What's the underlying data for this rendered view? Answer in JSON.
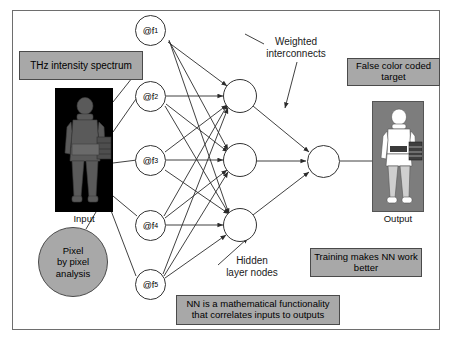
{
  "diagram": {
    "title_labels": {
      "weighted_interconnects": "Weighted\ninterconnects",
      "hidden_layer_nodes": "Hidden\nlayer nodes",
      "input_caption": "Input",
      "output_caption": "Output"
    },
    "callout_boxes": [
      {
        "id": "thz-spectrum",
        "text": "THz intensity spectrum"
      },
      {
        "id": "false-color",
        "text": "False color coded\ntarget"
      },
      {
        "id": "training",
        "text": "Training makes NN work\nbetter"
      },
      {
        "id": "nn-definition",
        "text": "NN is a mathematical functionality\nthat correlates inputs to outputs"
      }
    ],
    "pixel_circle": {
      "text": "Pixel\nby pixel\nanalysis"
    },
    "input_nodes": [
      {
        "label": "@f",
        "sub": "1"
      },
      {
        "label": "@f",
        "sub": "2"
      },
      {
        "label": "@f",
        "sub": "3"
      },
      {
        "label": "@f",
        "sub": "4"
      },
      {
        "label": "@f",
        "sub": "5"
      }
    ],
    "hidden_nodes": [
      {
        "label": ""
      },
      {
        "label": ""
      },
      {
        "label": ""
      }
    ],
    "output_nodes": [
      {
        "label": ""
      }
    ],
    "colors": {
      "callout_fill": "#a8a8a8",
      "callout_border": "#4a4a4a",
      "frame_border": "#6e6e6e",
      "input_panel_bg": "#000000",
      "output_panel_bg": "#7d7d7d",
      "figure_gray": "#5a5a5a",
      "figure_white": "#ffffff",
      "node_stroke": "#333333",
      "wire_stroke": "#2b2b2b"
    }
  }
}
